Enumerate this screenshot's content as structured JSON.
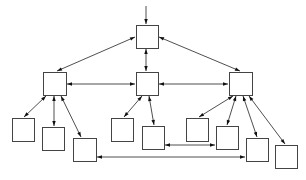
{
  "diagram": {
    "type": "hierarchy",
    "colors": {
      "stroke": "#444444",
      "edge": "#222222",
      "background": "#ffffff",
      "fill": "#ffffff"
    },
    "nodes": [
      {
        "id": "root",
        "x": 136,
        "y": 25,
        "w": 22,
        "h": 23,
        "label": ""
      },
      {
        "id": "mid-left",
        "x": 43,
        "y": 72,
        "w": 23,
        "h": 23,
        "label": ""
      },
      {
        "id": "mid-center",
        "x": 136,
        "y": 72,
        "w": 22,
        "h": 23,
        "label": ""
      },
      {
        "id": "mid-right",
        "x": 229,
        "y": 72,
        "w": 23,
        "h": 23,
        "label": ""
      },
      {
        "id": "leaf-a",
        "x": 12,
        "y": 118,
        "w": 22,
        "h": 23,
        "label": ""
      },
      {
        "id": "leaf-b",
        "x": 42,
        "y": 127,
        "w": 22,
        "h": 23,
        "label": ""
      },
      {
        "id": "leaf-c",
        "x": 73,
        "y": 138,
        "w": 23,
        "h": 23,
        "label": ""
      },
      {
        "id": "leaf-d",
        "x": 111,
        "y": 118,
        "w": 22,
        "h": 23,
        "label": ""
      },
      {
        "id": "leaf-e",
        "x": 142,
        "y": 126,
        "w": 22,
        "h": 23,
        "label": ""
      },
      {
        "id": "leaf-f",
        "x": 186,
        "y": 118,
        "w": 22,
        "h": 23,
        "label": ""
      },
      {
        "id": "leaf-g",
        "x": 216,
        "y": 126,
        "w": 22,
        "h": 23,
        "label": ""
      },
      {
        "id": "leaf-h",
        "x": 246,
        "y": 138,
        "w": 22,
        "h": 23,
        "label": ""
      },
      {
        "id": "leaf-i",
        "x": 275,
        "y": 145,
        "w": 22,
        "h": 23,
        "label": ""
      }
    ],
    "edges": [
      {
        "from": "entry",
        "to": "root",
        "x1": 146,
        "y1": 6,
        "x2": 146,
        "y2": 24,
        "start_arrow": false,
        "end_arrow": true
      },
      {
        "from": "root",
        "to": "mid-left",
        "x1": 135,
        "y1": 37,
        "x2": 57,
        "y2": 71,
        "start_arrow": true,
        "end_arrow": true
      },
      {
        "from": "root",
        "to": "mid-center",
        "x1": 146,
        "y1": 49,
        "x2": 146,
        "y2": 71,
        "start_arrow": true,
        "end_arrow": true
      },
      {
        "from": "root",
        "to": "mid-right",
        "x1": 159,
        "y1": 37,
        "x2": 240,
        "y2": 71,
        "start_arrow": true,
        "end_arrow": true
      },
      {
        "from": "mid-left",
        "to": "mid-center",
        "x1": 67,
        "y1": 84,
        "x2": 135,
        "y2": 84,
        "start_arrow": true,
        "end_arrow": true
      },
      {
        "from": "mid-center",
        "to": "mid-right",
        "x1": 159,
        "y1": 84,
        "x2": 228,
        "y2": 84,
        "start_arrow": true,
        "end_arrow": true
      },
      {
        "from": "mid-left",
        "to": "leaf-a",
        "x1": 46,
        "y1": 96,
        "x2": 24,
        "y2": 117,
        "start_arrow": true,
        "end_arrow": true
      },
      {
        "from": "mid-left",
        "to": "leaf-b",
        "x1": 54,
        "y1": 96,
        "x2": 54,
        "y2": 126,
        "start_arrow": true,
        "end_arrow": true
      },
      {
        "from": "mid-left",
        "to": "leaf-c",
        "x1": 61,
        "y1": 96,
        "x2": 81,
        "y2": 137,
        "start_arrow": true,
        "end_arrow": true
      },
      {
        "from": "mid-center",
        "to": "leaf-d",
        "x1": 142,
        "y1": 96,
        "x2": 124,
        "y2": 117,
        "start_arrow": true,
        "end_arrow": true
      },
      {
        "from": "mid-center",
        "to": "leaf-e",
        "x1": 149,
        "y1": 96,
        "x2": 154,
        "y2": 125,
        "start_arrow": true,
        "end_arrow": true
      },
      {
        "from": "mid-right",
        "to": "leaf-f",
        "x1": 233,
        "y1": 96,
        "x2": 199,
        "y2": 117,
        "start_arrow": true,
        "end_arrow": true
      },
      {
        "from": "mid-right",
        "to": "leaf-g",
        "x1": 236,
        "y1": 96,
        "x2": 227,
        "y2": 125,
        "start_arrow": true,
        "end_arrow": true
      },
      {
        "from": "mid-right",
        "to": "leaf-h",
        "x1": 243,
        "y1": 96,
        "x2": 257,
        "y2": 137,
        "start_arrow": true,
        "end_arrow": true
      },
      {
        "from": "mid-right",
        "to": "leaf-i",
        "x1": 249,
        "y1": 96,
        "x2": 285,
        "y2": 144,
        "start_arrow": true,
        "end_arrow": true
      },
      {
        "from": "leaf-e",
        "to": "leaf-g",
        "x1": 165,
        "y1": 145,
        "x2": 215,
        "y2": 145,
        "start_arrow": true,
        "end_arrow": true
      },
      {
        "from": "leaf-c",
        "to": "leaf-h",
        "x1": 97,
        "y1": 157,
        "x2": 245,
        "y2": 157,
        "start_arrow": true,
        "end_arrow": true
      }
    ]
  }
}
